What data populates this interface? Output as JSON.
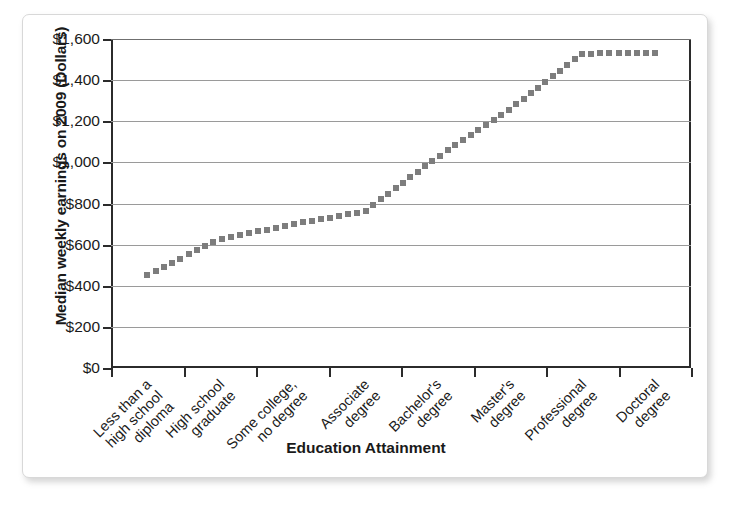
{
  "chart_data": {
    "type": "line",
    "title": "",
    "xlabel": "Education Attainment",
    "ylabel": "Median weekly earnings on 2009 (Dollars)",
    "categories": [
      "Less than a high school diploma",
      "High school graduate",
      "Some college, no degree",
      "Associate degree",
      "Bachelor's degree",
      "Master's degree",
      "Professional degree",
      "Doctoral degree"
    ],
    "category_lines": [
      [
        "Less than a",
        "high school",
        "diploma"
      ],
      [
        "High school",
        "graduate"
      ],
      [
        "Some college,",
        "no degree"
      ],
      [
        "Associate",
        "degree"
      ],
      [
        "Bachelor's",
        "degree"
      ],
      [
        "Master's",
        "degree"
      ],
      [
        "Professional",
        "degree"
      ],
      [
        "Doctoral",
        "degree"
      ]
    ],
    "values": [
      454,
      626,
      699,
      761,
      1025,
      1257,
      1529,
      1532
    ],
    "ylim": [
      0,
      1600
    ],
    "ytick_values": [
      0,
      200,
      400,
      600,
      800,
      1000,
      1200,
      1400,
      1600
    ],
    "ytick_labels": [
      "$0",
      "$200",
      "$400",
      "$600",
      "$800",
      "$1,000",
      "$1,200",
      "$1,400",
      "$1,600"
    ],
    "grid": true,
    "legend": "none",
    "series_style": "dotted",
    "series_color": "#7d7d7d"
  }
}
